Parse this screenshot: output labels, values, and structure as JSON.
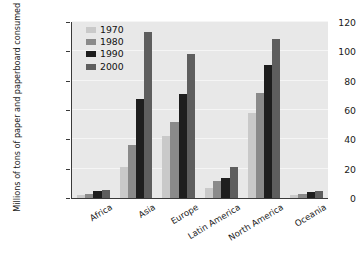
{
  "chart_data": {
    "type": "bar",
    "title": "",
    "subtitle": "",
    "xlabel": "",
    "ylabel": "Millions of tons of paper and paperboard consumed",
    "ylim": [
      0,
      120
    ],
    "yticks": [
      0,
      20,
      40,
      60,
      80,
      100,
      120
    ],
    "grid": true,
    "legend_position": "top-left-inside",
    "categories": [
      "Africa",
      "Asia",
      "Europe",
      "Latin America",
      "North America",
      "Oceania"
    ],
    "series": [
      {
        "name": "1970",
        "color": "#c9c9c9",
        "values": [
          2,
          21,
          42,
          6.5,
          58,
          2
        ]
      },
      {
        "name": "1980",
        "color": "#8a8a8a",
        "values": [
          3,
          36,
          52,
          11.5,
          71.5,
          3
        ]
      },
      {
        "name": "1990",
        "color": "#1e1e1e",
        "values": [
          4.5,
          67.5,
          71,
          13.5,
          91,
          4
        ]
      },
      {
        "name": "2000",
        "color": "#5e5e5e",
        "values": [
          5.5,
          113,
          98,
          21,
          108.5,
          5
        ]
      }
    ]
  },
  "legend": {
    "items": [
      {
        "label": "1970"
      },
      {
        "label": "1980"
      },
      {
        "label": "1990"
      },
      {
        "label": "2000"
      }
    ]
  },
  "colors": {
    "plot_background": "#e8e8e8",
    "page_background": "#ffffff",
    "axis": "#3a3a3a",
    "gridline": "#f5f5f5",
    "text": "#1a1a1a"
  }
}
